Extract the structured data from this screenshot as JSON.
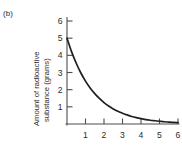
{
  "figure": {
    "panel_label": "(b)"
  },
  "chart_data": {
    "type": "line",
    "title": "",
    "subtitle": "",
    "xlabel": "",
    "ylabel": "Amount of radioactive substance (grams)",
    "ylabel_lines": [
      "Amount of radioactive",
      "substance (grams)"
    ],
    "xlim": [
      0,
      6
    ],
    "ylim": [
      0,
      6
    ],
    "xticks": [
      1,
      2,
      3,
      4,
      5,
      6
    ],
    "yticks": [
      1,
      2,
      3,
      4,
      5,
      6
    ],
    "xticklabels": [
      "1",
      "2",
      "3",
      "4",
      "5",
      "6"
    ],
    "yticklabels": [
      "1",
      "2",
      "3",
      "4",
      "5",
      "6"
    ],
    "grid": false,
    "legend": false,
    "legend_position": "none",
    "annotations": [],
    "curve_color": "#1f1f1f",
    "axis_color": "#4d4d4d",
    "background_color": "#ffffff",
    "series": [
      {
        "name": "radioactive substance",
        "x": [
          0,
          0.25,
          0.5,
          0.75,
          1,
          1.25,
          1.5,
          1.75,
          2,
          2.25,
          2.5,
          2.75,
          3,
          3.25,
          3.5,
          3.75,
          4,
          4.25,
          4.5,
          4.75,
          5,
          5.25,
          5.5,
          5.75,
          6
        ],
        "values": [
          5,
          4.2,
          3.54,
          2.97,
          2.5,
          2.1,
          1.77,
          1.49,
          1.25,
          1.05,
          0.88,
          0.74,
          0.63,
          0.53,
          0.44,
          0.37,
          0.31,
          0.26,
          0.22,
          0.19,
          0.16,
          0.13,
          0.11,
          0.09,
          0.08
        ]
      }
    ]
  }
}
